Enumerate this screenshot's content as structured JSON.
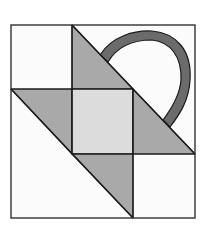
{
  "diagram": {
    "title": "Basket quilt block",
    "colors": {
      "background": "#ffffff",
      "outline": "#1a1a1a",
      "triangle_fill": "#a9a9a9",
      "center_fill": "#dcdcdc",
      "handle_fill": "#6b6b6b",
      "empty_fill": "#fbfbfb"
    },
    "pieces": [
      {
        "name": "top-triangle",
        "fill": "triangle_fill"
      },
      {
        "name": "left-triangle",
        "fill": "triangle_fill"
      },
      {
        "name": "center-square",
        "fill": "center_fill"
      },
      {
        "name": "right-triangle",
        "fill": "triangle_fill"
      },
      {
        "name": "bottom-triangle",
        "fill": "triangle_fill"
      },
      {
        "name": "basket-handle",
        "fill": "handle_fill"
      }
    ]
  }
}
